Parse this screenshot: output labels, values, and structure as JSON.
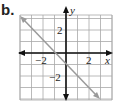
{
  "figure": {
    "label": "b."
  },
  "chart_data": {
    "type": "line",
    "title": "",
    "xlabel": "x",
    "ylabel": "y",
    "xlim": [
      -4,
      4
    ],
    "ylim": [
      -4,
      3.5
    ],
    "grid": true,
    "x_ticks": [
      {
        "value": -2,
        "label": "−2"
      },
      {
        "value": 2,
        "label": "2"
      }
    ],
    "y_ticks": [
      {
        "value": 2,
        "label": "2"
      },
      {
        "value": -2,
        "label": "−2"
      }
    ],
    "series": [
      {
        "name": "line",
        "equation": "y = -x - 1",
        "slope": -1,
        "intercept": -1,
        "x": [
          -4,
          3
        ],
        "y": [
          3,
          -4
        ],
        "color": "#9a9a9a",
        "arrows": "both"
      }
    ],
    "axes_color": "#111111",
    "grid_color": "#a0a0a0"
  }
}
